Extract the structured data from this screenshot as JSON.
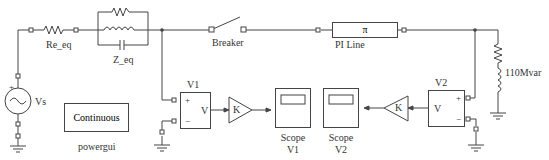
{
  "diagram": {
    "source": {
      "label": "Vs",
      "plus": "+"
    },
    "re_eq": {
      "label": "Re_eq"
    },
    "z_eq": {
      "label": "Z_eq"
    },
    "breaker": {
      "label": "Breaker"
    },
    "pi_line": {
      "label": "PI Line",
      "symbol": "π"
    },
    "load": {
      "label": "110Mvar"
    },
    "powergui": {
      "mode": "Continuous",
      "label": "powergui"
    },
    "v1": {
      "title": "V1",
      "out": "V",
      "plus": "+",
      "minus": "−"
    },
    "v2": {
      "title": "V2",
      "out": "V",
      "plus": "+",
      "minus": "−"
    },
    "gain1": {
      "label": "K"
    },
    "gain2": {
      "label": "K"
    },
    "scope1": {
      "label_line1": "Scope",
      "label_line2": "V1"
    },
    "scope2": {
      "label_line1": "Scope",
      "label_line2": "V2"
    }
  },
  "colors": {
    "line": "#444444",
    "text": "#333333"
  }
}
